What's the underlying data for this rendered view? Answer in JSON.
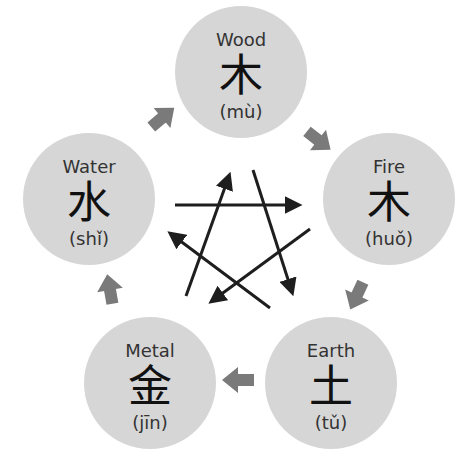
{
  "diagram": {
    "colors": {
      "circle_fill": "#d6d6d6",
      "generating_arrow": "#7a7a7a",
      "controlling_arrow": "#1e1e1e",
      "text": "#333333"
    },
    "elements": [
      {
        "id": "wood",
        "name": "Wood",
        "char": "木",
        "pinyin": "(mù)",
        "cx": 241,
        "cy": 72
      },
      {
        "id": "fire",
        "name": "Fire",
        "char": "木",
        "pinyin": "(huǒ)",
        "cx": 389,
        "cy": 199
      },
      {
        "id": "earth",
        "name": "Earth",
        "char": "土",
        "pinyin": "(tǔ)",
        "cx": 331,
        "cy": 383
      },
      {
        "id": "metal",
        "name": "Metal",
        "char": "金",
        "pinyin": "(jīn)",
        "cx": 150,
        "cy": 383
      },
      {
        "id": "water",
        "name": "Water",
        "char": "水",
        "pinyin": "(shǐ)",
        "cx": 89,
        "cy": 199
      }
    ],
    "generating_cycle": [
      {
        "from": "Wood",
        "to": "Fire"
      },
      {
        "from": "Fire",
        "to": "Earth"
      },
      {
        "from": "Earth",
        "to": "Metal"
      },
      {
        "from": "Metal",
        "to": "Water"
      },
      {
        "from": "Water",
        "to": "Wood"
      }
    ],
    "controlling_cycle": [
      {
        "from": "Wood",
        "to": "Earth"
      },
      {
        "from": "Earth",
        "to": "Water"
      },
      {
        "from": "Water",
        "to": "Fire"
      },
      {
        "from": "Fire",
        "to": "Metal"
      },
      {
        "from": "Metal",
        "to": "Wood"
      }
    ]
  }
}
